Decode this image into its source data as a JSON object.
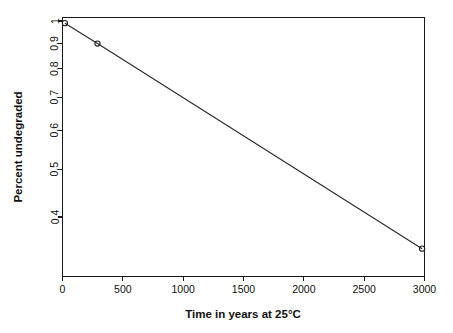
{
  "chart_data": {
    "type": "line",
    "title": "",
    "xlabel": "Time in years at 25°C",
    "ylabel": "Percent undegraded",
    "x": [
      20,
      290,
      2980
    ],
    "values": [
      0.99,
      0.9,
      0.345
    ],
    "series": [
      {
        "name": "Percent undegraded",
        "x": [
          20,
          290,
          2980
        ],
        "values": [
          0.99,
          0.9,
          0.345
        ],
        "marker": "open-circle",
        "line": "solid"
      }
    ],
    "xlim": [
      0,
      3000
    ],
    "ylim": [
      0.33,
      1.0
    ],
    "xscale": "linear",
    "yscale": "log",
    "grid": false,
    "legend": false,
    "legend_position": "none",
    "xticks": [
      0,
      500,
      1000,
      1500,
      2000,
      2500,
      3000
    ],
    "xticklabels": [
      "0",
      "500",
      "1000",
      "1500",
      "2000",
      "2500",
      "3000"
    ],
    "yticks": [
      1,
      0.9,
      0.8,
      0.7,
      0.6,
      0.5,
      0.4
    ],
    "yticklabels": [
      "1",
      "0.9",
      "0.8",
      "0.7",
      "0.6",
      "0.5",
      "0.4"
    ],
    "annotations": []
  },
  "figure": {
    "background_color": "#ffffff",
    "foreground_color": "#111111",
    "line_color": "#2b2b2b",
    "marker_color": "#1f1f1f"
  }
}
